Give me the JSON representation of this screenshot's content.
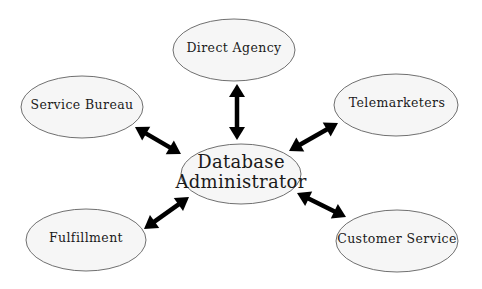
{
  "diagram": {
    "type": "hub-and-spoke",
    "center": {
      "id": "dba",
      "label_lines": [
        "Database",
        "Administrator"
      ]
    },
    "nodes": [
      {
        "id": "direct-agency",
        "label": "Direct Agency"
      },
      {
        "id": "service-bureau",
        "label": "Service Bureau"
      },
      {
        "id": "telemarketers",
        "label": "Telemarketers"
      },
      {
        "id": "fulfillment",
        "label": "Fulfillment"
      },
      {
        "id": "customer-service",
        "label": "Customer Service"
      }
    ],
    "edges": [
      {
        "from": "dba",
        "to": "direct-agency",
        "direction": "bidirectional"
      },
      {
        "from": "dba",
        "to": "service-bureau",
        "direction": "bidirectional"
      },
      {
        "from": "dba",
        "to": "telemarketers",
        "direction": "bidirectional"
      },
      {
        "from": "dba",
        "to": "fulfillment",
        "direction": "bidirectional"
      },
      {
        "from": "dba",
        "to": "customer-service",
        "direction": "bidirectional"
      }
    ]
  }
}
